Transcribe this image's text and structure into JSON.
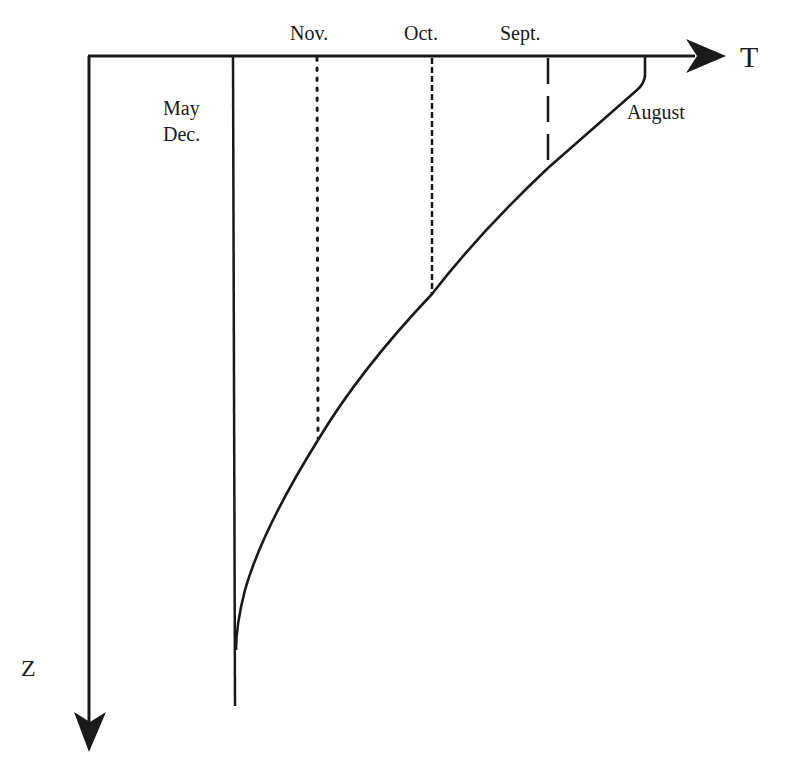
{
  "diagram": {
    "type": "temperature-depth profile schematic",
    "axes": {
      "x": {
        "label": "T",
        "direction": "right"
      },
      "y": {
        "label": "Z",
        "direction": "down"
      }
    },
    "profiles": [
      {
        "label_line1": "May",
        "label_line2": "Dec.",
        "style": "solid",
        "shape": "vertical line (isothermal)"
      },
      {
        "label": "Nov.",
        "style": "dotted",
        "shape": "vertical, mixed layer to mid depth"
      },
      {
        "label": "Oct.",
        "style": "short-dashed",
        "shape": "vertical, mixed layer to shallow-mid depth"
      },
      {
        "label": "Sept.",
        "style": "long-dashed",
        "shape": "vertical, shallow mixed layer"
      },
      {
        "label": "August",
        "style": "solid",
        "shape": "curve from surface (warmest) decaying to deep value"
      }
    ],
    "colors": {
      "ink": "#1a1a1a",
      "background": "#ffffff"
    }
  },
  "labels": {
    "t_axis": "T",
    "z_axis": "Z",
    "may": "May",
    "dec": "Dec.",
    "nov": "Nov.",
    "oct": "Oct.",
    "sept": "Sept.",
    "august": "August"
  }
}
